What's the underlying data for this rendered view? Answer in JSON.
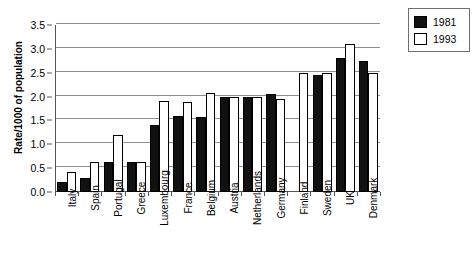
{
  "chart_data": {
    "type": "bar",
    "title": "",
    "xlabel": "",
    "ylabel": "Rate/1000 of population",
    "ylim": [
      0,
      3.5
    ],
    "ytick_labels": [
      "0.0",
      "0.5",
      "1.0",
      "1.5",
      "2.0",
      "2.5",
      "3.0",
      "3.5"
    ],
    "ytick_values": [
      0.0,
      0.5,
      1.0,
      1.5,
      2.0,
      2.5,
      3.0,
      3.5
    ],
    "grid": true,
    "legend_position": "top-right",
    "categories": [
      "Italy",
      "Spain",
      "Portugal",
      "Greece",
      "Luxembourg",
      "France",
      "Belgium",
      "Austria",
      "Netherlands",
      "Germany",
      "Finland",
      "Sweden",
      "UK",
      "Denmark"
    ],
    "series": [
      {
        "name": "1981",
        "color": "#111111",
        "values": [
          0.21,
          0.3,
          0.63,
          0.63,
          1.41,
          1.6,
          1.58,
          2.0,
          2.0,
          2.05,
          0.0,
          2.45,
          2.8,
          2.74
        ]
      },
      {
        "name": "1993",
        "color": "#ffffff",
        "values": [
          0.41,
          0.63,
          1.2,
          0.63,
          1.9,
          1.89,
          2.08,
          2.0,
          2.0,
          1.95,
          2.5,
          2.5,
          3.1,
          2.5
        ]
      }
    ]
  },
  "legend": {
    "entries": [
      {
        "label": "1981"
      },
      {
        "label": "1993"
      }
    ]
  }
}
